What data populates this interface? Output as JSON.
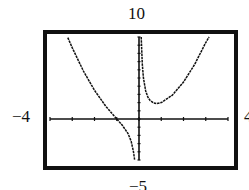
{
  "chart_data": {
    "type": "line",
    "title": "",
    "function_shape": "y = x^2 + 1/x (vertical asymptote at x = 0)",
    "xlim": [
      -4,
      4
    ],
    "ylim": [
      -5,
      10
    ],
    "grid": false,
    "axis_tick_spacing_x": 1,
    "axis_tick_spacing_y": 1,
    "window_labels": {
      "ymax": "10",
      "ymin": "−5",
      "xmin": "−4",
      "xmax": "4"
    },
    "series": [
      {
        "name": "left branch",
        "x": [
          -3.2,
          -3.0,
          -2.5,
          -2.0,
          -1.5,
          -1.0,
          -0.75,
          -0.5,
          -0.35,
          -0.25,
          -0.2
        ],
        "y": [
          9.93,
          8.67,
          5.85,
          3.5,
          1.58,
          0.0,
          -0.77,
          -1.75,
          -2.73,
          -3.94,
          -4.96
        ]
      },
      {
        "name": "right branch",
        "x": [
          0.1,
          0.15,
          0.2,
          0.3,
          0.4,
          0.5,
          0.65,
          0.79,
          1.0,
          1.5,
          2.0,
          2.5,
          3.0,
          3.15
        ],
        "y": [
          10.01,
          6.69,
          5.04,
          3.42,
          2.66,
          2.25,
          1.96,
          1.89,
          2.0,
          2.92,
          4.5,
          6.65,
          9.33,
          10.24
        ]
      }
    ]
  },
  "labels": {
    "top": "10",
    "bottom": "−5",
    "left": "−4",
    "right": "4"
  }
}
